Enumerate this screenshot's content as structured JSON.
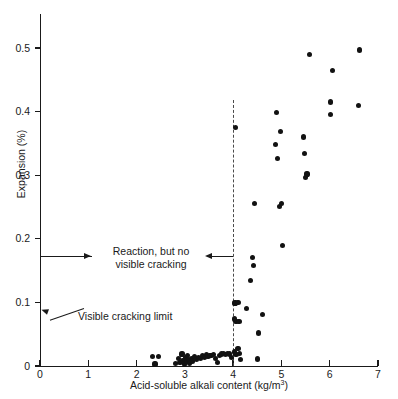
{
  "chart_data": {
    "type": "scatter",
    "title": "",
    "xlabel": "Acid-soluble alkali content (kg/m3)",
    "xlabel_display": "Acid-soluble alkali content (kg/m",
    "xlabel_superscript": "3",
    "xlabel_suffix": ")",
    "ylabel": "Expansion (%)",
    "xlim": [
      0,
      7
    ],
    "ylim": [
      0,
      0.56
    ],
    "xticks": [
      0,
      1,
      2,
      3,
      4,
      5,
      6,
      7
    ],
    "xtick_labels": [
      "0",
      "1",
      "2",
      "3",
      "4",
      "5",
      "6",
      "7"
    ],
    "yticks": [
      0,
      0.1,
      0.2,
      0.3,
      0.4,
      0.5
    ],
    "ytick_labels": [
      "0",
      "0.1",
      "0.2",
      "0.3",
      "0.4",
      "0.5"
    ],
    "grid": false,
    "legend": null,
    "marker_color": "#121212",
    "axis_color": "#1a1a1a",
    "points": [
      [
        2.33,
        0.015
      ],
      [
        2.38,
        0.003
      ],
      [
        2.45,
        0.015
      ],
      [
        2.8,
        0.004
      ],
      [
        2.86,
        0.012
      ],
      [
        2.9,
        0.005
      ],
      [
        2.94,
        0.019
      ],
      [
        2.96,
        0.008
      ],
      [
        2.99,
        0.003
      ],
      [
        3.01,
        0.013
      ],
      [
        3.03,
        0.007
      ],
      [
        3.05,
        0.016
      ],
      [
        3.07,
        0.01
      ],
      [
        3.1,
        0.004
      ],
      [
        3.13,
        0.012
      ],
      [
        3.16,
        0.008
      ],
      [
        3.2,
        0.015
      ],
      [
        3.24,
        0.01
      ],
      [
        3.28,
        0.014
      ],
      [
        3.32,
        0.012
      ],
      [
        3.36,
        0.016
      ],
      [
        3.4,
        0.013
      ],
      [
        3.44,
        0.018
      ],
      [
        3.48,
        0.015
      ],
      [
        3.52,
        0.017
      ],
      [
        3.56,
        0.016
      ],
      [
        3.6,
        0.018
      ],
      [
        3.64,
        0.012
      ],
      [
        3.68,
        0.006
      ],
      [
        3.72,
        0.017
      ],
      [
        3.76,
        0.019
      ],
      [
        3.8,
        0.02
      ],
      [
        3.84,
        0.018
      ],
      [
        3.88,
        0.02
      ],
      [
        3.92,
        0.019
      ],
      [
        3.96,
        0.013
      ],
      [
        4.02,
        0.022
      ],
      [
        4.06,
        0.018
      ],
      [
        4.1,
        0.027
      ],
      [
        4.14,
        0.02
      ],
      [
        4.16,
        0.01
      ],
      [
        4.5,
        0.011
      ],
      [
        4.05,
        0.375
      ],
      [
        4.04,
        0.099
      ],
      [
        4.1,
        0.1
      ],
      [
        4.02,
        0.074
      ],
      [
        4.06,
        0.07
      ],
      [
        4.12,
        0.07
      ],
      [
        4.28,
        0.09
      ],
      [
        4.36,
        0.134
      ],
      [
        4.42,
        0.158
      ],
      [
        4.4,
        0.171
      ],
      [
        4.45,
        0.256
      ],
      [
        4.52,
        0.052
      ],
      [
        4.6,
        0.081
      ],
      [
        4.88,
        0.348
      ],
      [
        4.9,
        0.398
      ],
      [
        4.92,
        0.326
      ],
      [
        4.96,
        0.251
      ],
      [
        4.98,
        0.369
      ],
      [
        5.0,
        0.256
      ],
      [
        5.02,
        0.189
      ],
      [
        5.45,
        0.36
      ],
      [
        5.47,
        0.334
      ],
      [
        5.5,
        0.296
      ],
      [
        5.53,
        0.302
      ],
      [
        5.58,
        0.49
      ],
      [
        6.02,
        0.415
      ],
      [
        6.02,
        0.396
      ],
      [
        6.05,
        0.465
      ],
      [
        6.6,
        0.41
      ],
      [
        6.62,
        0.497
      ]
    ],
    "annotations": [
      {
        "id": "reaction-annotation",
        "text_line_1": "Reaction, but no",
        "text_line_2": "visible cracking",
        "y_value": 0.173,
        "x_span": [
          0.0,
          4.0
        ],
        "arrows": "both"
      },
      {
        "id": "visible-cracking-limit-annotation",
        "text": "Visible cracking limit",
        "points_to": [
          0.0,
          0.085
        ],
        "arrows": "single"
      }
    ],
    "reference_lines": [
      {
        "id": "alkali-threshold",
        "orientation": "vertical",
        "x_value": 4.0,
        "style": "dashed",
        "color": "#4a4a4a"
      }
    ]
  }
}
